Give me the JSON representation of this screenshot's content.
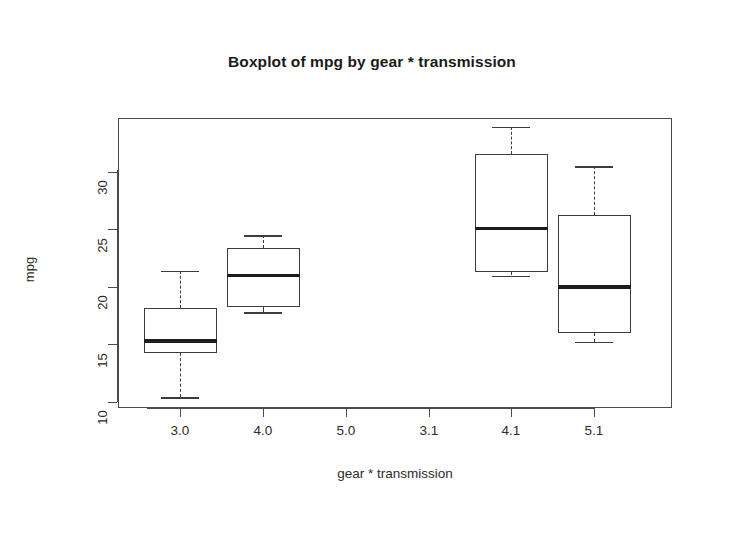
{
  "chart_data": {
    "type": "box",
    "title": "Boxplot of mpg by gear * transmission",
    "xlabel": "gear * transmission",
    "ylabel": "mpg",
    "grid": false,
    "legend": "none",
    "ylim": [
      9,
      34.5
    ],
    "yticks": [
      10,
      15,
      20,
      25,
      30
    ],
    "ytick_labels": [
      "10",
      "15",
      "20",
      "25",
      "30"
    ],
    "categories": [
      "3.0",
      "4.0",
      "5.0",
      "3.1",
      "4.1",
      "5.1"
    ],
    "boxes": [
      {
        "category": "3.0",
        "empty": false,
        "min": 10.4,
        "q1": 14.3,
        "median": 15.3,
        "q3": 18.2,
        "max": 21.4
      },
      {
        "category": "4.0",
        "empty": false,
        "min": 17.8,
        "q1": 18.3,
        "median": 21.0,
        "q3": 23.4,
        "max": 24.5
      },
      {
        "category": "5.0",
        "empty": true,
        "min": null,
        "q1": null,
        "median": null,
        "q3": null,
        "max": null
      },
      {
        "category": "3.1",
        "empty": true,
        "min": null,
        "q1": null,
        "median": null,
        "q3": null,
        "max": null
      },
      {
        "category": "4.1",
        "empty": false,
        "min": 21.0,
        "q1": 21.3,
        "median": 25.1,
        "q3": 31.6,
        "max": 33.9
      },
      {
        "category": "5.1",
        "empty": false,
        "min": 15.2,
        "q1": 16.0,
        "median": 20.0,
        "q3": 26.3,
        "max": 30.5
      }
    ]
  },
  "style": {
    "axis_color": "#4a4a4a",
    "box_color": "#3c3c3c",
    "median_color": "#1d1d1d",
    "text_color": "#2b2b2b",
    "background": "#ffffff"
  }
}
